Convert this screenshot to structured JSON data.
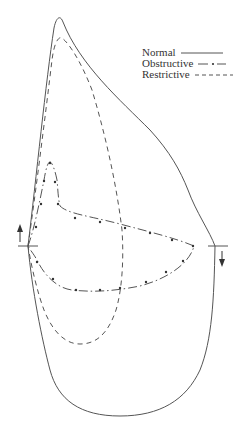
{
  "legend": {
    "items": [
      {
        "label": "Normal",
        "style": "solid"
      },
      {
        "label": "Obstructive",
        "style": "dash-dot"
      },
      {
        "label": "Restrictive",
        "style": "dashed"
      }
    ]
  },
  "colors": {
    "line": "#555555",
    "background": "#ffffff"
  },
  "diagram": {
    "type": "flow-volume-loop",
    "curves": [
      "normal",
      "obstructive",
      "restrictive"
    ],
    "arrows": [
      "inspiration-up-arrow",
      "expiration-down-arrow"
    ]
  }
}
